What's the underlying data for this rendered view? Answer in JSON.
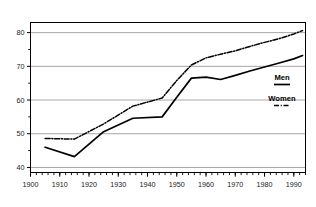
{
  "chart_data": {
    "type": "line",
    "title": "",
    "subtitle": "",
    "xlabel": "",
    "ylabel": "",
    "xlim": [
      1900,
      1994
    ],
    "ylim": [
      38.5,
      83
    ],
    "grid": true,
    "grid_axis": "y",
    "legend_position": "center-right",
    "x_ticks": [
      1900,
      1910,
      1920,
      1930,
      1940,
      1950,
      1960,
      1970,
      1980,
      1990
    ],
    "x_tick_labels": [
      "1900",
      "1910",
      "1920",
      "1930",
      "1940",
      "1950",
      "1960",
      "1970",
      "1980",
      "1990"
    ],
    "x_minor_tick_interval": 2,
    "y_ticks": [
      40,
      50,
      60,
      70,
      80
    ],
    "y_tick_labels": [
      "40",
      "50",
      "60",
      "70",
      "80"
    ],
    "y_minor_ticks": [
      45,
      55,
      65,
      75
    ],
    "x": [
      1905,
      1915,
      1925,
      1935,
      1945,
      1950,
      1955,
      1960,
      1965,
      1970,
      1975,
      1980,
      1985,
      1990,
      1993
    ],
    "series": [
      {
        "name": "Men",
        "style": "solid",
        "color": "#000000",
        "values": [
          46.0,
          43.2,
          50.6,
          54.6,
          55.0,
          60.8,
          66.5,
          66.8,
          66.1,
          67.3,
          68.6,
          69.8,
          71.0,
          72.2,
          73.2
        ]
      },
      {
        "name": "Women",
        "style": "dash-dot",
        "color": "#000000",
        "values": [
          48.6,
          48.4,
          52.9,
          58.2,
          60.6,
          65.8,
          70.4,
          72.5,
          73.6,
          74.6,
          75.9,
          77.1,
          78.2,
          79.6,
          80.6
        ]
      }
    ]
  },
  "legend": {
    "entries": [
      {
        "label": "Men",
        "style": "solid"
      },
      {
        "label": "Women",
        "style": "dash-dot"
      }
    ]
  },
  "axes": {
    "frame_color": "#000000",
    "grid_color": "#808080"
  }
}
